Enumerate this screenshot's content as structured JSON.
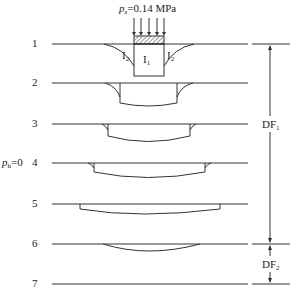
{
  "load": {
    "symbol": "p",
    "subscript": "z",
    "value": "=0.14 MPa"
  },
  "levels": [
    "1",
    "2",
    "3",
    "4",
    "5",
    "6",
    "7"
  ],
  "zones": {
    "inner": "I",
    "inner_sub": "1",
    "outer": "I",
    "outer_sub": "2"
  },
  "ph": {
    "symbol": "p",
    "subscript": "h",
    "value": "=0"
  },
  "dims": [
    {
      "label": "DF",
      "sub": "1"
    },
    {
      "label": "DF",
      "sub": "2"
    }
  ]
}
